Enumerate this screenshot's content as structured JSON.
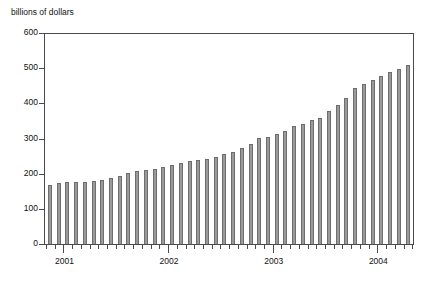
{
  "chart_data": {
    "type": "bar",
    "title": "billions of dollars",
    "xlabel": "",
    "ylabel": "billions of dollars",
    "ylim": [
      0,
      600
    ],
    "ytick_labels": [
      "600",
      "500",
      "400",
      "300",
      "200",
      "100",
      "0"
    ],
    "ytick_values": [
      600,
      500,
      400,
      300,
      200,
      100,
      0
    ],
    "xtick_labels": [
      "2001",
      "2002",
      "2003",
      "2004"
    ],
    "xtick_values": [
      2001,
      2002,
      2003,
      2004
    ],
    "grid": false,
    "legend": "none",
    "bar_color": "#9a9a9a",
    "bar_edge_color": "#6d6d6d",
    "axis_color": "#4a4a4a",
    "categories": [
      "2000-11",
      "2000-12",
      "2001-01",
      "2001-02",
      "2001-03",
      "2001-04",
      "2001-05",
      "2001-06",
      "2001-07",
      "2001-08",
      "2001-09",
      "2001-10",
      "2001-11",
      "2001-12",
      "2002-01",
      "2002-02",
      "2002-03",
      "2002-04",
      "2002-05",
      "2002-06",
      "2002-07",
      "2002-08",
      "2002-09",
      "2002-10",
      "2002-11",
      "2002-12",
      "2003-01",
      "2003-02",
      "2003-03",
      "2003-04",
      "2003-05",
      "2003-06",
      "2003-07",
      "2003-08",
      "2003-09",
      "2003-10",
      "2003-11",
      "2003-12"
    ],
    "values": [
      168,
      175,
      176,
      177,
      178,
      180,
      182,
      189,
      194,
      202,
      208,
      211,
      215,
      221,
      226,
      232,
      236,
      240,
      243,
      250,
      257,
      264,
      273,
      285,
      302,
      306,
      314,
      324,
      337,
      342,
      353,
      361,
      381,
      398,
      417,
      445,
      457,
      468
    ],
    "values_tail": [
      481,
      491,
      500,
      512
    ]
  }
}
